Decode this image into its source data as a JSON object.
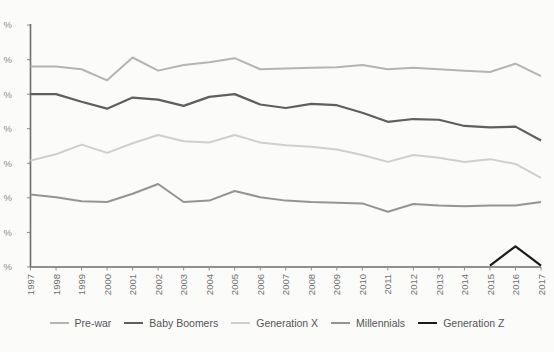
{
  "chart_data": {
    "type": "line",
    "title": "",
    "subtitle": "",
    "xlabel": "",
    "ylabel": "",
    "grid": false,
    "legend_position": "bottom",
    "categories": [
      "1997",
      "1998",
      "1999",
      "2000",
      "2001",
      "2002",
      "2003",
      "2004",
      "2005",
      "2006",
      "2007",
      "2008",
      "2009",
      "2010",
      "2011",
      "2012",
      "2013",
      "2014",
      "2015",
      "2016",
      "2017"
    ],
    "x": [
      1997,
      1998,
      1999,
      2000,
      2001,
      2002,
      2003,
      2004,
      2005,
      2006,
      2007,
      2008,
      2009,
      2010,
      2011,
      2012,
      2013,
      2014,
      2015,
      2016,
      2017
    ],
    "ylim": [
      0,
      35
    ],
    "yticks": [
      0,
      5,
      10,
      15,
      20,
      25,
      30,
      35
    ],
    "ytick_labels": [
      "%",
      "%",
      "%",
      "%",
      "%",
      "%",
      "%",
      "%"
    ],
    "ytick_labels_truncated": true,
    "series": [
      {
        "name": "Pre-war",
        "color": "#b4b4b4",
        "width": 2.0,
        "values": [
          29.0,
          29.0,
          28.6,
          27.0,
          30.3,
          28.4,
          29.2,
          29.6,
          30.2,
          28.6,
          28.7,
          28.8,
          28.9,
          29.2,
          28.6,
          28.8,
          28.6,
          28.4,
          28.2,
          29.4,
          27.6
        ]
      },
      {
        "name": "Baby Boomers",
        "color": "#5f5f5f",
        "width": 2.2,
        "values": [
          25.0,
          25.0,
          23.9,
          22.9,
          24.5,
          24.2,
          23.3,
          24.6,
          25.0,
          23.5,
          23.0,
          23.6,
          23.4,
          22.3,
          21.0,
          21.4,
          21.3,
          20.4,
          20.2,
          20.3,
          18.3
        ]
      },
      {
        "name": "Generation X",
        "color": "#cfcfcf",
        "width": 2.0,
        "values": [
          15.4,
          16.3,
          17.7,
          16.5,
          17.9,
          19.1,
          18.2,
          18.0,
          19.1,
          18.0,
          17.6,
          17.4,
          17.0,
          16.2,
          15.2,
          16.2,
          15.8,
          15.2,
          15.6,
          14.9,
          12.9
        ]
      },
      {
        "name": "Millennials",
        "color": "#949494",
        "width": 2.0,
        "values": [
          10.5,
          10.1,
          9.5,
          9.4,
          10.6,
          12.0,
          9.4,
          9.6,
          11.0,
          10.1,
          9.6,
          9.4,
          9.3,
          9.2,
          8.0,
          9.1,
          8.9,
          8.8,
          8.9,
          8.9,
          9.4
        ]
      },
      {
        "name": "Generation Z",
        "color": "#1b1b1b",
        "width": 2.2,
        "first_year": 2015,
        "values": [
          null,
          null,
          null,
          null,
          null,
          null,
          null,
          null,
          null,
          null,
          null,
          null,
          null,
          null,
          null,
          null,
          null,
          null,
          0.2,
          3.0,
          0.2
        ]
      }
    ]
  },
  "legend": {
    "items": [
      {
        "label": "Pre-war",
        "color": "#b4b4b4",
        "width": 2.0
      },
      {
        "label": "Baby Boomers",
        "color": "#5f5f5f",
        "width": 2.6
      },
      {
        "label": "Generation X",
        "color": "#cfcfcf",
        "width": 2.0
      },
      {
        "label": "Millennials",
        "color": "#949494",
        "width": 2.0
      },
      {
        "label": "Generation Z",
        "color": "#1b1b1b",
        "width": 2.6
      }
    ]
  },
  "axes": {
    "x_axis_name": "year-axis",
    "y_axis_name": "percent-axis"
  }
}
